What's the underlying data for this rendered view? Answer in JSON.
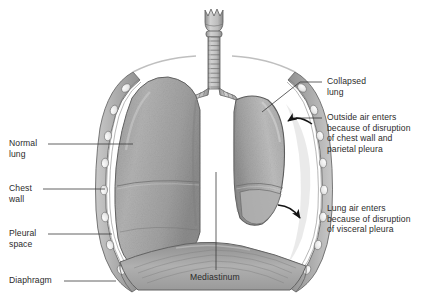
{
  "figure": {
    "type": "anatomical-illustration",
    "palette": {
      "background": "#ffffff",
      "lung_tissue": "#a9a9a9",
      "lung_tissue_light": "#c4c4c4",
      "lung_tissue_dark": "#8d8d8d",
      "chest_wall": "#b5b5b5",
      "rib": "#f0f0f0",
      "pleura_line": "#6f6f6f",
      "outline": "#555555",
      "diaphragm": "#9b9b9b",
      "trachea": "#bdbdbd",
      "text": "#2b2b2b",
      "leader_line": "#3a3a3a",
      "arrow": "#1a1a1a"
    }
  },
  "labels": {
    "normal_lung": "Normal\nlung",
    "chest_wall": "Chest\nwall",
    "pleural_space": "Pleural\nspace",
    "diaphragm": "Diaphragm",
    "mediastinum": "Mediastinum",
    "collapsed_lung": "Collapsed\nlung",
    "outside_air": "Outside air enters\nbecause of disruption\nof chest wall and\nparietal pleura",
    "lung_air": "Lung air enters\nbecause of disruption\nof visceral pleura"
  },
  "anatomy": {
    "parts": [
      {
        "name": "larynx",
        "side": "center"
      },
      {
        "name": "trachea",
        "side": "center",
        "rings": 11
      },
      {
        "name": "left-main-bronchus",
        "side": "left"
      },
      {
        "name": "right-main-bronchus",
        "side": "right"
      },
      {
        "name": "normal-lung",
        "side": "left",
        "state": "inflated",
        "lobes": 3
      },
      {
        "name": "collapsed-lung",
        "side": "right",
        "state": "collapsed",
        "lobes": 2
      },
      {
        "name": "chest-wall",
        "side": "both",
        "ribs_per_side": 7
      },
      {
        "name": "pleural-space",
        "side": "both"
      },
      {
        "name": "diaphragm",
        "side": "both"
      },
      {
        "name": "mediastinum",
        "side": "center"
      }
    ],
    "arrows": [
      {
        "name": "outside-air-arrow",
        "points_to": "pleural-space-upper-right"
      },
      {
        "name": "lung-air-arrow",
        "points_to": "pleural-space-lower-right"
      }
    ]
  }
}
